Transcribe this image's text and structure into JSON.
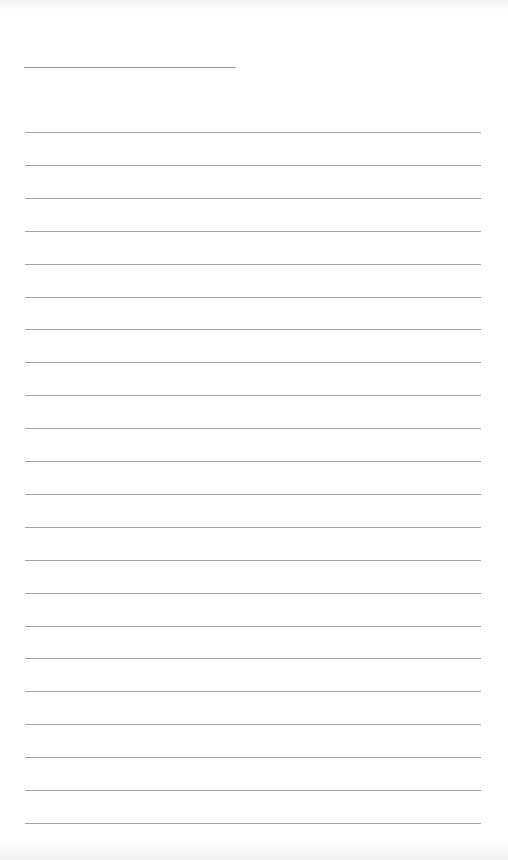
{
  "page": {
    "type": "blank-lined-page",
    "background_color": "#ffffff",
    "line_color": "#a3a3a3"
  },
  "header_line": {
    "x_start": 24,
    "x_end": 236,
    "y": 67
  },
  "ruled_lines": {
    "count": 22,
    "first_y": 132,
    "spacing": 32.9,
    "x_start": 25,
    "x_end": 481
  }
}
